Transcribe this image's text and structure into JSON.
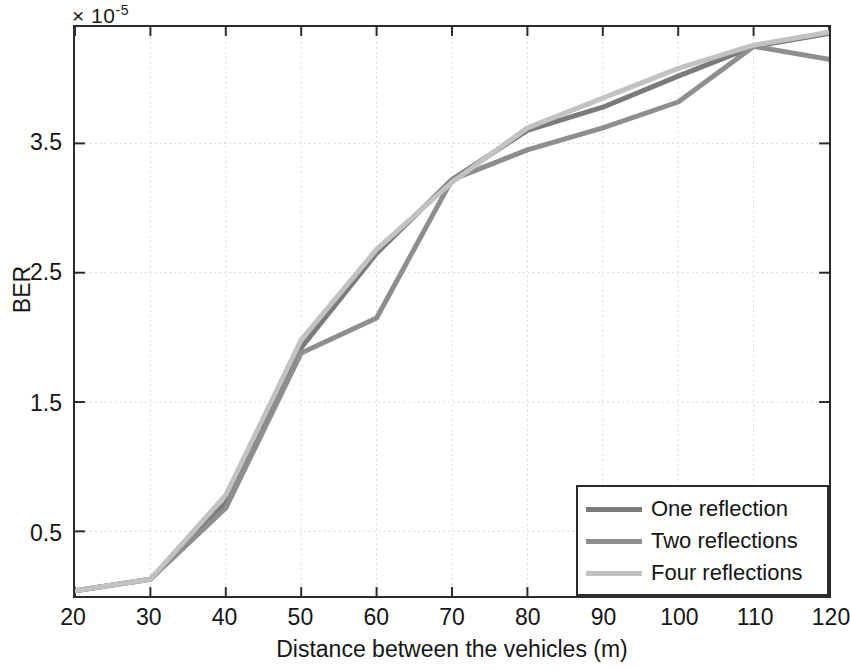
{
  "figure": {
    "exponent_label": "× 10",
    "exponent_sup": "-5"
  },
  "axes": {
    "x_title": "Distance between the vehicles  (m)",
    "y_title": "BER",
    "x_ticks": [
      "20",
      "30",
      "40",
      "50",
      "60",
      "70",
      "80",
      "90",
      "100",
      "110",
      "120"
    ],
    "y_ticks": [
      "0.5",
      "1.5",
      "2.5",
      "3.5"
    ]
  },
  "legend": {
    "items": [
      {
        "label": "One reflection",
        "color": "#7a7a7a"
      },
      {
        "label": "Two reflections",
        "color": "#8e8e8e"
      },
      {
        "label": "Four reflections",
        "color": "#c2c2c2"
      }
    ]
  },
  "chart_data": {
    "type": "line",
    "title": "",
    "xlabel": "Distance between the vehicles  (m)",
    "ylabel": "BER",
    "y_multiplier": "1e-5",
    "xlim": [
      20,
      120
    ],
    "ylim": [
      0,
      4.4
    ],
    "x_ticks": [
      20,
      30,
      40,
      50,
      60,
      70,
      80,
      90,
      100,
      110,
      120
    ],
    "y_ticks": [
      0.5,
      1.5,
      2.5,
      3.5
    ],
    "grid": true,
    "legend_position": "lower right",
    "x": [
      20,
      30,
      40,
      50,
      60,
      70,
      80,
      90,
      100,
      110,
      120
    ],
    "series": [
      {
        "name": "One reflection",
        "color": "#7a7a7a",
        "values": [
          0.04,
          0.13,
          0.72,
          1.92,
          2.65,
          3.22,
          3.6,
          3.78,
          4.02,
          4.25,
          4.35
        ]
      },
      {
        "name": "Two reflections",
        "color": "#8e8e8e",
        "values": [
          0.04,
          0.13,
          0.68,
          1.88,
          2.15,
          3.22,
          3.45,
          3.62,
          3.82,
          4.25,
          4.15
        ]
      },
      {
        "name": "Four reflections",
        "color": "#c2c2c2",
        "values": [
          0.04,
          0.13,
          0.78,
          1.98,
          2.68,
          3.2,
          3.62,
          3.85,
          4.08,
          4.26,
          4.36
        ]
      }
    ]
  }
}
